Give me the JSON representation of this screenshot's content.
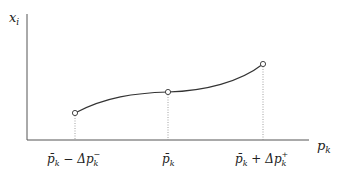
{
  "diagram": {
    "y_axis_label": "x",
    "y_axis_sub": "i",
    "x_axis_label": "p",
    "x_axis_sub": "k",
    "ticks": [
      {
        "base": "p̄",
        "sub": "k",
        "op": " − Δp",
        "opsub": "k",
        "opsup": "−"
      },
      {
        "base": "p̄",
        "sub": "k"
      },
      {
        "base": "p̄",
        "sub": "k",
        "op": " + Δp",
        "opsub": "k",
        "opsup": "+"
      }
    ],
    "points": [
      {
        "x": 75,
        "y": 113
      },
      {
        "x": 168,
        "y": 92
      },
      {
        "x": 263,
        "y": 64
      }
    ],
    "colors": {
      "axis": "#555555",
      "curve": "#333333",
      "dotted": "#888888"
    }
  }
}
